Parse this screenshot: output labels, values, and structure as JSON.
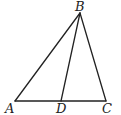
{
  "diagram": {
    "points": {
      "A": {
        "label": "A",
        "x": 15,
        "y": 101
      },
      "B": {
        "label": "B",
        "x": 80,
        "y": 13
      },
      "C": {
        "label": "C",
        "x": 106,
        "y": 101
      },
      "D": {
        "label": "D",
        "x": 61,
        "y": 101
      }
    },
    "segments": [
      {
        "from": "A",
        "to": "B"
      },
      {
        "from": "B",
        "to": "C"
      },
      {
        "from": "A",
        "to": "C"
      },
      {
        "from": "B",
        "to": "D"
      }
    ],
    "colors": {
      "stroke": "#222222",
      "background": "#ffffff"
    }
  }
}
